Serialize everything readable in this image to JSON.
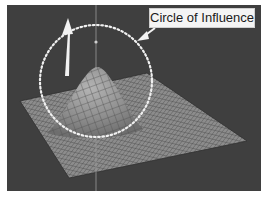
{
  "figure": {
    "annotation": {
      "label": "Circle of Influence",
      "pointer": "arrow-to-circle"
    },
    "elements": {
      "plane": "grid-mesh-plane",
      "bump": "raised-mesh-peak",
      "circle": "dotted-influence-circle",
      "direction_arrow": "upward-white-arrow",
      "axis_line": "vertical-axis-line"
    },
    "colors": {
      "viewport_bg": "#3f3f3f",
      "mesh": "#8a8a8a",
      "mesh_lines": "#555555",
      "circle": "#f0f0f0",
      "arrow": "#f2f2f2",
      "label_bg": "#f4f4f4"
    }
  }
}
